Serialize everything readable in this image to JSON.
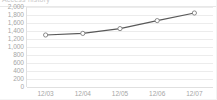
{
  "widget": {
    "title": "Access history",
    "title_color": "#c9c9c9"
  },
  "chart_data": {
    "type": "line",
    "title": "Access history",
    "xlabel": "",
    "ylabel": "",
    "categories": [
      "12/03",
      "12/04",
      "12/05",
      "12/06",
      "12/07"
    ],
    "values": [
      1300,
      1340,
      1460,
      1660,
      1850
    ],
    "series": [
      {
        "name": "Visits",
        "values": [
          1300,
          1340,
          1460,
          1660,
          1850
        ]
      }
    ],
    "ylim": [
      0,
      2000
    ],
    "ytick_values": [
      2000,
      1800,
      1600,
      1400,
      1200,
      1000,
      800,
      600,
      400,
      200,
      0
    ],
    "ytick_labels": [
      "2,000",
      "1,800",
      "1,600",
      "1,400",
      "1,200",
      "1,000",
      "800",
      "600",
      "400",
      "200",
      "0"
    ],
    "grid": true,
    "grid_axis": "y",
    "legend": false,
    "legend_position": "none",
    "line_color": "#595959",
    "marker_fill": "#ffffff",
    "marker_edge": "#7f7f7f",
    "gridline_color": "#ececec",
    "tick_label_color": "#a6a6a6",
    "plot_background": "#ffffff"
  }
}
